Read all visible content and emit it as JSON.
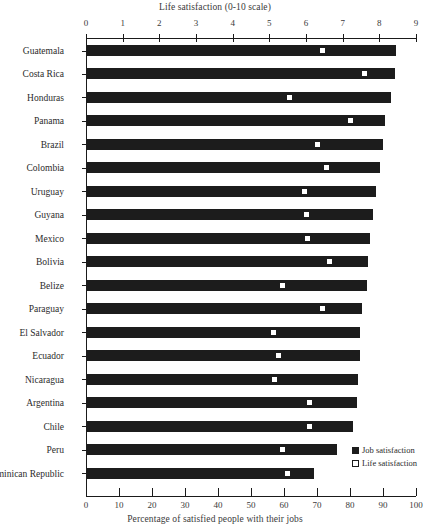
{
  "chart_data": {
    "type": "bar",
    "title": "",
    "orientation": "horizontal",
    "top_axis_label": "Life satisfaction (0-10 scale)",
    "xlabel": "Percentage of satisfied people with their jobs",
    "ylabel": "",
    "grid": false,
    "xlim": [
      0,
      100
    ],
    "top_xlim": [
      0,
      9
    ],
    "bottom_ticks": [
      "0",
      "10",
      "20",
      "30",
      "40",
      "50",
      "60",
      "70",
      "80",
      "90",
      "100"
    ],
    "bottom_tick_values": [
      0,
      10,
      20,
      30,
      40,
      50,
      60,
      70,
      80,
      90,
      100
    ],
    "top_ticks": [
      "0",
      "1",
      "2",
      "3",
      "4",
      "5",
      "6",
      "7",
      "8",
      "9"
    ],
    "top_tick_values": [
      0,
      1,
      2,
      3,
      4,
      5,
      6,
      7,
      8,
      9
    ],
    "categories": [
      "Guatemala",
      "Costa Rica",
      "Honduras",
      "Panama",
      "Brazil",
      "Colombia",
      "Uruguay",
      "Guyana",
      "Mexico",
      "Bolivia",
      "Belize",
      "Paraguay",
      "El Salvador",
      "Ecuador",
      "Nicaragua",
      "Argentina",
      "Chile",
      "Peru",
      "Dominican Republic"
    ],
    "legend_position": "bottom-right",
    "series": [
      {
        "name": "Job satisfaction",
        "unit": "percent",
        "axis": "bottom",
        "color": "#1c1c1c",
        "values": [
          94,
          93.5,
          92.5,
          90.5,
          90,
          89,
          88,
          87,
          86,
          85.5,
          85,
          83.5,
          83,
          83,
          82.5,
          82,
          81,
          76,
          69
        ]
      },
      {
        "name": "Life satisfaction",
        "unit": "0-10 scale",
        "axis": "top",
        "color": "#ffffff",
        "values": [
          6.45,
          7.6,
          5.55,
          7.2,
          6.3,
          6.55,
          5.95,
          6.0,
          6.05,
          6.65,
          5.35,
          6.45,
          5.1,
          5.25,
          5.15,
          6.1,
          6.1,
          5.35,
          5.5
        ]
      }
    ]
  },
  "legend": {
    "items": [
      {
        "label": "Job satisfaction",
        "swatch": "filled-square"
      },
      {
        "label": "Life satisfaction",
        "swatch": "open-square"
      }
    ]
  },
  "colors": {
    "bar": "#1c1c1c",
    "marker_fill": "#ffffff",
    "marker_stroke": "#1c1c1c",
    "axis": "#1a1a1a",
    "text": "#2b2b2b",
    "background": "#ffffff"
  }
}
